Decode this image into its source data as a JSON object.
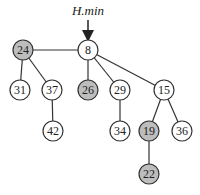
{
  "diagram": {
    "pointer_label": "H.min",
    "pointer_target": "8",
    "colors": {
      "marked": "#bdbdbd",
      "unmarked": "#ffffff",
      "stroke": "#333333"
    },
    "nodes": [
      {
        "id": "n24",
        "key": "24",
        "x": 23,
        "y": 50,
        "marked": true
      },
      {
        "id": "n8",
        "key": "8",
        "x": 88,
        "y": 50,
        "marked": false
      },
      {
        "id": "n31",
        "key": "31",
        "x": 20,
        "y": 90,
        "marked": false
      },
      {
        "id": "n37",
        "key": "37",
        "x": 52,
        "y": 90,
        "marked": false
      },
      {
        "id": "n26",
        "key": "26",
        "x": 88,
        "y": 90,
        "marked": true
      },
      {
        "id": "n29",
        "key": "29",
        "x": 120,
        "y": 90,
        "marked": false
      },
      {
        "id": "n15",
        "key": "15",
        "x": 164,
        "y": 90,
        "marked": false
      },
      {
        "id": "n42",
        "key": "42",
        "x": 53,
        "y": 131,
        "marked": false
      },
      {
        "id": "n34",
        "key": "34",
        "x": 120,
        "y": 131,
        "marked": false
      },
      {
        "id": "n19",
        "key": "19",
        "x": 149,
        "y": 131,
        "marked": true
      },
      {
        "id": "n36",
        "key": "36",
        "x": 182,
        "y": 131,
        "marked": false
      },
      {
        "id": "n22",
        "key": "22",
        "x": 149,
        "y": 174,
        "marked": true
      }
    ],
    "root_list": [
      "24",
      "8"
    ],
    "edges": [
      [
        "24",
        "8"
      ],
      [
        "24",
        "31"
      ],
      [
        "24",
        "37"
      ],
      [
        "37",
        "42"
      ],
      [
        "8",
        "26"
      ],
      [
        "8",
        "29"
      ],
      [
        "8",
        "15"
      ],
      [
        "29",
        "34"
      ],
      [
        "15",
        "19"
      ],
      [
        "15",
        "36"
      ],
      [
        "19",
        "22"
      ]
    ]
  }
}
